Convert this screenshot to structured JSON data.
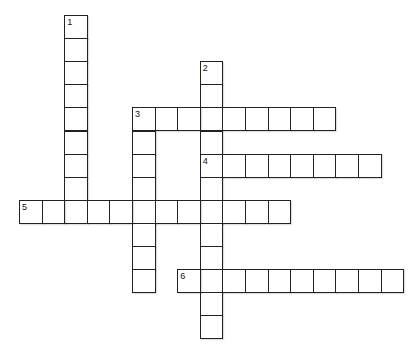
{
  "puzzle": {
    "type": "crossword",
    "cell_size": {
      "w": 22.6,
      "h": 23.1
    },
    "origin": {
      "x": 19,
      "y": 15
    },
    "entries": [
      {
        "number": "1",
        "direction": "down",
        "col": 2,
        "row": 0,
        "length": 9
      },
      {
        "number": "2",
        "direction": "down",
        "col": 8,
        "row": 2,
        "length": 12
      },
      {
        "number": "3",
        "direction": "across",
        "col": 5,
        "row": 4,
        "length": 9
      },
      {
        "number": "3",
        "direction": "down",
        "col": 5,
        "row": 4,
        "length": 8
      },
      {
        "number": "4",
        "direction": "across",
        "col": 8,
        "row": 6,
        "length": 8
      },
      {
        "number": "5",
        "direction": "across",
        "col": 0,
        "row": 8,
        "length": 12
      },
      {
        "number": "6",
        "direction": "across",
        "col": 7,
        "row": 11,
        "length": 10
      }
    ]
  }
}
